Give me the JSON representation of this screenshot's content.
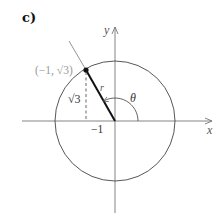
{
  "figure": {
    "panel_label": "c)",
    "axes": {
      "x_label": "x",
      "y_label": "y"
    },
    "point_label": "(−1, √3)",
    "point_label_color": "#9a9a9a",
    "height_label": "√3",
    "radius_label": "r",
    "angle_label": "θ",
    "x_tick_label": "−1",
    "colors": {
      "axis": "#777777",
      "circle": "#444444",
      "radius": "#111111",
      "extension": "#888888"
    }
  }
}
